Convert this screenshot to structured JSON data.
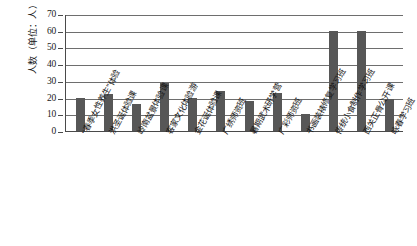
{
  "chart_data": {
    "type": "bar",
    "title": "",
    "subtitle": "",
    "xlabel": "",
    "ylabel": "人数（单位：人）",
    "ylim": [
      0,
      70
    ],
    "yticks": [
      0,
      10,
      20,
      30,
      40,
      50,
      60,
      70
    ],
    "grid": true,
    "legend": "none",
    "bar_color": "#575757",
    "categories": [
      "“春季女性养生”体验",
      "洪圣诞体验课",
      "岭南盆景体验课",
      "客家文化体验游",
      "金花诞体验课",
      "广绣师资班",
      "暑期武术研学营",
      "广彩师资班",
      "书画装裱修复学习班",
      "传统小食制作学习班",
      "西关正骨公开课",
      "咏春学习班"
    ],
    "values": [
      20,
      22,
      16,
      29,
      20,
      24,
      18,
      23,
      10,
      60,
      60,
      19
    ],
    "axis_color": "#4a4a4a",
    "grid_color": "#6e6e6e"
  }
}
